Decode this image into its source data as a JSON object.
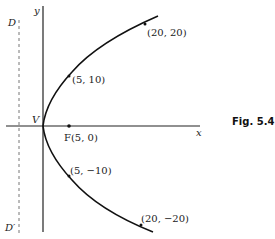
{
  "figure": {
    "caption": "Fig. 5.4",
    "equation_implied": "y^2 = 20x",
    "axes": {
      "x_label": "x",
      "y_label": "y"
    },
    "vertex_label": "V",
    "focus": {
      "label": "F(5, 0)",
      "x": 5,
      "y": 0
    },
    "directrix": {
      "top_label": "D",
      "bottom_label": "D′",
      "x": -5
    },
    "points": [
      {
        "label": "(20, 20)",
        "x": 20,
        "y": 20
      },
      {
        "label": "(5, 10)",
        "x": 5,
        "y": 10
      },
      {
        "label": "(5, −10)",
        "x": 5,
        "y": -10
      },
      {
        "label": "(20, −20)",
        "x": 20,
        "y": -20
      }
    ],
    "colors": {
      "curve": "#111111",
      "axis": "#222222",
      "directrix": "#777777"
    }
  }
}
